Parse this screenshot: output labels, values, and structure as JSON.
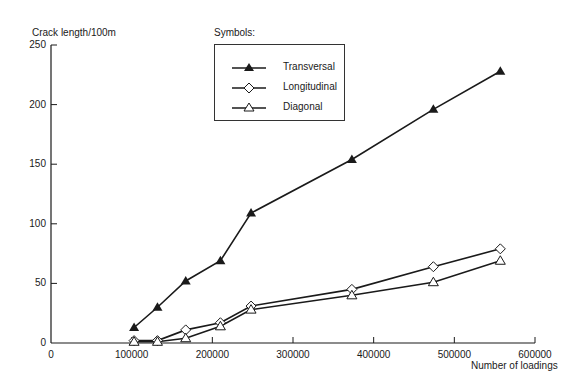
{
  "chart_data": {
    "type": "line",
    "title": "",
    "xlabel": "Number of loadings",
    "ylabel": "Crack length/100m",
    "xlim": [
      0,
      600000
    ],
    "ylim": [
      0,
      250
    ],
    "xticks": [
      0,
      100000,
      200000,
      300000,
      400000,
      500000,
      600000
    ],
    "yticks": [
      0,
      50,
      100,
      150,
      200,
      250
    ],
    "xtick_labels": [
      "0",
      "100000",
      "200000",
      "300000",
      "400000",
      "500000",
      "600000"
    ],
    "ytick_labels": [
      "0",
      "50",
      "100",
      "150",
      "200",
      "250"
    ],
    "grid": false,
    "legend_title": "Symbols:",
    "legend_position": "upper-center",
    "x": [
      103000,
      132000,
      167000,
      210000,
      248000,
      373000,
      474000,
      557000
    ],
    "series": [
      {
        "name": "Transversal",
        "marker": "filled-triangle",
        "values": [
          13,
          30,
          52,
          69,
          109,
          154,
          196,
          228
        ]
      },
      {
        "name": "Longitudinal",
        "marker": "open-diamond",
        "values": [
          2,
          2,
          11,
          17,
          31,
          45,
          64,
          79
        ]
      },
      {
        "name": "Diagonal",
        "marker": "open-triangle",
        "values": [
          1,
          1,
          4,
          14,
          28,
          40,
          51,
          69
        ]
      }
    ]
  },
  "colors": {
    "line": "#1a1a1a",
    "background": "#ffffff"
  }
}
